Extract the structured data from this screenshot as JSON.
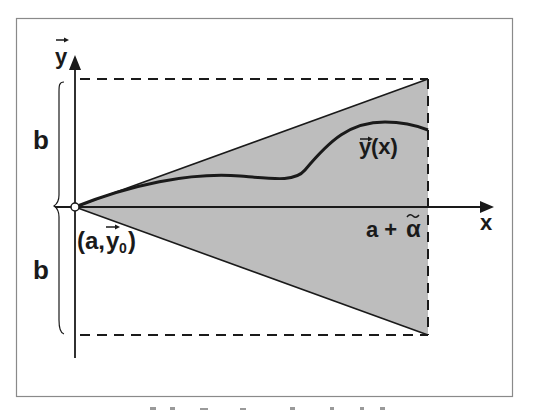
{
  "figure": {
    "type": "diagram",
    "colors": {
      "background": "#ffffff",
      "frame": "#8a8a8a",
      "ink": "#1a1a1a",
      "shaded_region": "#bdbdbd"
    },
    "axes": {
      "y_label": "y",
      "y_label_vector": true,
      "x_label": "x"
    },
    "labels": {
      "upper_brace": "b",
      "lower_brace": "b",
      "initial_point": "(a,",
      "initial_point_y": "y",
      "initial_point_sub": "0",
      "initial_point_close": ")",
      "solution_curve": "y",
      "solution_curve_arg": "(x)",
      "right_bound": "a + ",
      "right_bound_alpha": "α"
    },
    "caption": {
      "text": "",
      "note": "caption cut off at bottom edge, not legible"
    }
  }
}
